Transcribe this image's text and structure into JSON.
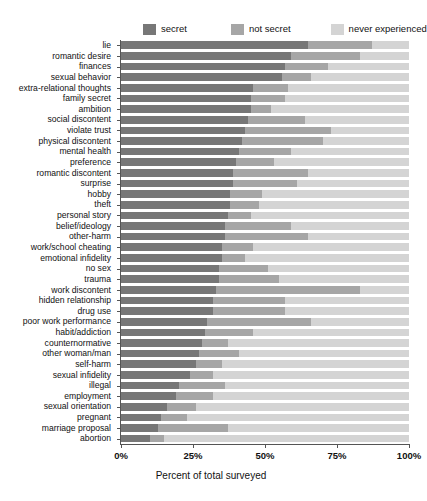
{
  "chart_data": {
    "type": "bar",
    "orientation": "horizontal",
    "stacked": true,
    "title": "",
    "xlabel": "Percent of total surveyed",
    "ylabel": "",
    "xlim": [
      0,
      100
    ],
    "xticks": [
      0,
      25,
      50,
      75,
      100
    ],
    "xticklabels": [
      "0%",
      "25%",
      "50%",
      "75%",
      "100%"
    ],
    "grid": false,
    "legend_position": "top",
    "legend": [
      "secret",
      "not secret",
      "never experienced"
    ],
    "colors": {
      "secret": "#777777",
      "not_secret": "#a6a6a6",
      "never_experienced": "#d4d4d4",
      "axis": "#555555",
      "text": "#111111",
      "background": "#ffffff"
    },
    "categories": [
      "lie",
      "romantic desire",
      "finances",
      "sexual behavior",
      "extra-relational thoughts",
      "family secret",
      "ambition",
      "social discontent",
      "violate trust",
      "physical discontent",
      "mental health",
      "preference",
      "romantic discontent",
      "surprise",
      "hobby",
      "theft",
      "personal story",
      "belief/ideology",
      "other-harm",
      "work/school cheating",
      "emotional infidelity",
      "no sex",
      "trauma",
      "work discontent",
      "hidden relationship",
      "drug use",
      "poor work performance",
      "habit/addiction",
      "counternormative",
      "other woman/man",
      "self-harm",
      "sexual infidelity",
      "illegal",
      "employment",
      "sexual orientation",
      "pregnant",
      "marriage proposal",
      "abortion"
    ],
    "series": [
      {
        "name": "secret",
        "values": [
          65,
          59,
          57,
          56,
          46,
          45,
          45,
          44,
          43,
          42,
          41,
          40,
          39,
          39,
          38,
          38,
          37,
          36,
          36,
          35,
          35,
          34,
          34,
          33,
          32,
          32,
          30,
          29,
          28,
          27,
          26,
          24,
          20,
          19,
          16,
          14,
          13,
          10
        ]
      },
      {
        "name": "not secret",
        "values": [
          22,
          24,
          15,
          10,
          12,
          12,
          7,
          20,
          30,
          28,
          18,
          13,
          26,
          22,
          11,
          10,
          8,
          23,
          29,
          11,
          8,
          17,
          21,
          50,
          25,
          25,
          36,
          17,
          9,
          14,
          9,
          8,
          16,
          13,
          10,
          9,
          24,
          5
        ]
      },
      {
        "name": "never experienced",
        "values": [
          13,
          17,
          28,
          34,
          42,
          43,
          48,
          36,
          27,
          30,
          41,
          47,
          35,
          39,
          51,
          52,
          55,
          41,
          35,
          54,
          57,
          49,
          45,
          17,
          43,
          43,
          34,
          54,
          63,
          59,
          65,
          68,
          64,
          68,
          74,
          77,
          63,
          85
        ]
      }
    ]
  }
}
